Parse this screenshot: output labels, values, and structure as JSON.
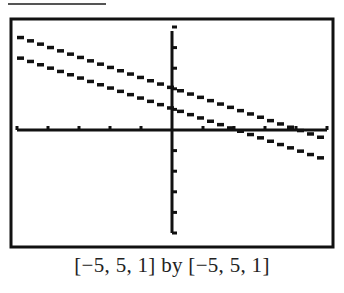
{
  "chart_data": {
    "type": "line",
    "title": "",
    "caption": "[−5, 5, 1] by [−5, 5, 1]",
    "xlabel": "",
    "ylabel": "",
    "xlim": [
      -5,
      5
    ],
    "ylim": [
      -5,
      5
    ],
    "xscl": 1,
    "yscl": 1,
    "grid": false,
    "legend": null,
    "style": "graphing-calculator pixelated stair-step lines",
    "series": [
      {
        "name": "upper line",
        "equation": "y = -0.5x + 2",
        "x": [
          -5,
          5
        ],
        "y": [
          4.5,
          -0.5
        ]
      },
      {
        "name": "lower line",
        "equation": "y = -0.5x + 1",
        "x": [
          -5,
          5
        ],
        "y": [
          3.5,
          -1.5
        ]
      }
    ]
  },
  "colors": {
    "ink": "#111111",
    "background": "#ffffff"
  }
}
